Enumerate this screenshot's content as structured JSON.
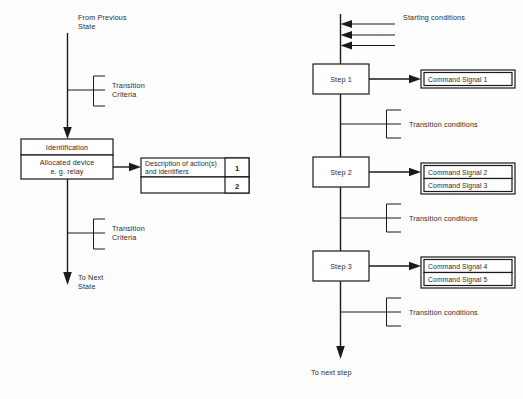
{
  "diagram": {
    "ink_color": "#1a1a1a",
    "background_color": "#fdfdfd"
  },
  "left_diagram": {
    "entry_label_line1": "From Previous",
    "entry_label_line2": "State",
    "exit_label_line1": "To Next",
    "exit_label_line2": "State",
    "transition_top": {
      "line1": "Transition",
      "line2": "Criteria"
    },
    "transition_bottom": {
      "line1": "Transition",
      "line2": "Criteria"
    },
    "state_box": {
      "header": "Identification",
      "body_line1": "Allocated device",
      "body_line2": "e. g. relay"
    },
    "action_table": {
      "rows": [
        {
          "description_line1": "Description of action(s)",
          "description_line2": "and identifiers",
          "identifier": "1"
        },
        {
          "description_line1": "",
          "description_line2": "",
          "identifier": "2"
        }
      ]
    }
  },
  "right_diagram": {
    "starting_conditions_label": "Starting conditions",
    "starting_conditions_count": 3,
    "exit_label": "To next step",
    "steps": [
      {
        "name": "Step 1",
        "commands": [
          "Command Signal  1"
        ],
        "transition_label": "Transition conditions",
        "transition_prongs": 3
      },
      {
        "name": "Step 2",
        "commands": [
          "Command Signal  2",
          "Command Signal  3"
        ],
        "transition_label": "Transition conditions",
        "transition_prongs": 3
      },
      {
        "name": "Step 3",
        "commands": [
          "Command Signal  4",
          "Command Signal  5"
        ],
        "transition_label": "Transition conditions",
        "transition_prongs": 3
      }
    ]
  }
}
